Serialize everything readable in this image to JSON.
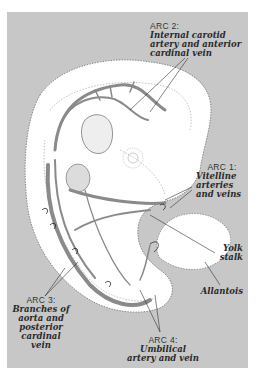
{
  "figure": {
    "background_color": "#c7c7c7",
    "embryo_fill": "#ffffff",
    "vessel_color": "#8a8a8a"
  },
  "labels": {
    "arc2": {
      "title": "ARC 2:",
      "desc_lines": [
        "Internal carotid",
        "artery and anterior",
        "cardinal vein"
      ]
    },
    "arc1": {
      "title": "ARC 1:",
      "desc_lines": [
        "Vitelline",
        "arteries",
        "and veins"
      ]
    },
    "yolk_stalk": {
      "desc_lines": [
        "Yolk",
        "stalk"
      ]
    },
    "allantois": {
      "desc_lines": [
        "Allantois"
      ]
    },
    "arc3": {
      "title": "ARC 3:",
      "desc_lines": [
        "Branches of",
        "aorta and",
        "posterior",
        "cardinal",
        "vein"
      ]
    },
    "arc4": {
      "title": "ARC 4:",
      "desc_lines": [
        "Umbilical",
        "artery and vein"
      ]
    }
  }
}
